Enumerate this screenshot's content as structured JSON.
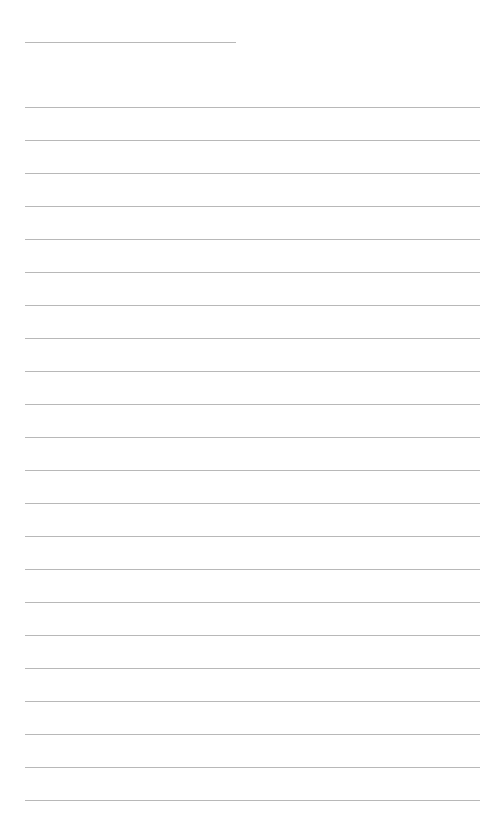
{
  "page": {
    "type": "blank lined page",
    "background_color": "#ffffff",
    "line_color": "#b8b8b8"
  },
  "title_line": {
    "left": 25,
    "top": 42,
    "width": 211
  },
  "ruled_lines": {
    "count": 22,
    "first_top": 107,
    "spacing": 33,
    "left": 25,
    "width": 455
  }
}
